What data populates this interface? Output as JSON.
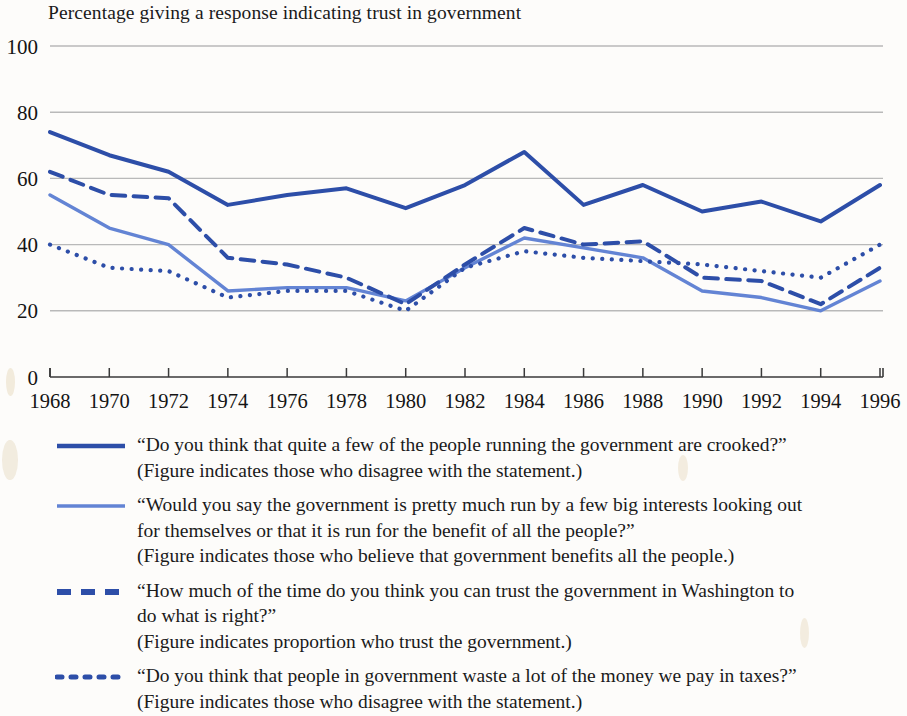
{
  "chart_data": {
    "type": "line",
    "title": "Percentage giving a response indicating trust in government",
    "xlabel": "",
    "ylabel": "",
    "ylim": [
      0,
      100
    ],
    "yticks": [
      0,
      20,
      40,
      60,
      80,
      100
    ],
    "xlim": [
      1968,
      1996
    ],
    "grid": true,
    "legend_position": "below",
    "x": [
      1968,
      1970,
      1972,
      1974,
      1976,
      1978,
      1980,
      1982,
      1984,
      1986,
      1988,
      1990,
      1992,
      1994,
      1996
    ],
    "categories": [
      "1968",
      "1970",
      "1972",
      "1974",
      "1976",
      "1978",
      "1980",
      "1982",
      "1984",
      "1986",
      "1988",
      "1990",
      "1992",
      "1994",
      "1996"
    ],
    "series": [
      {
        "name": "crooked",
        "style": "solid",
        "color": "#2d4ea8",
        "width": 4,
        "values": [
          74,
          67,
          62,
          52,
          55,
          57,
          51,
          58,
          68,
          52,
          58,
          50,
          53,
          47,
          58
        ]
      },
      {
        "name": "big-interests",
        "style": "solid",
        "color": "#6384d4",
        "width": 3.4,
        "values": [
          55,
          45,
          40,
          26,
          27,
          27,
          23,
          33,
          42,
          39,
          36,
          26,
          24,
          20,
          29
        ]
      },
      {
        "name": "trust-washington",
        "style": "dashed",
        "color": "#2d4ea8",
        "width": 4,
        "values": [
          62,
          55,
          54,
          36,
          34,
          30,
          22,
          34,
          45,
          40,
          41,
          30,
          29,
          22,
          33
        ]
      },
      {
        "name": "waste-taxes",
        "style": "dotted",
        "color": "#2d4ea8",
        "width": 4.2,
        "values": [
          40,
          33,
          32,
          24,
          26,
          26,
          20,
          33,
          38,
          36,
          35,
          34,
          32,
          30,
          40
        ]
      }
    ]
  },
  "legend": {
    "entries": [
      {
        "style": "solid-thick",
        "color": "#2d4ea8",
        "lines": [
          "“Do you think that quite a few of the people running the government are crooked?”",
          "(Figure indicates those who disagree with the statement.)"
        ]
      },
      {
        "style": "solid-thin",
        "color": "#6384d4",
        "lines": [
          "“Would you say the government is pretty much run by a few big interests looking out",
          "for themselves or that it is run for the benefit of all the people?”",
          "(Figure indicates those who believe that government benefits all the people.)"
        ]
      },
      {
        "style": "dashed",
        "color": "#2d4ea8",
        "lines": [
          "“How much of the time do you think you can trust the government in Washington to",
          "do what is right?”",
          "(Figure indicates proportion who trust the government.)"
        ]
      },
      {
        "style": "dotted",
        "color": "#2d4ea8",
        "lines": [
          "“Do you think that people in government waste a lot of the money we pay in taxes?”",
          "(Figure indicates those who disagree with the statement.)"
        ]
      }
    ]
  }
}
